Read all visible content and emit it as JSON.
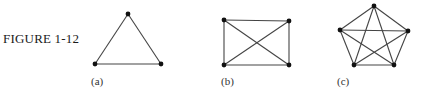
{
  "figure": {
    "caption": "FIGURE 1-12",
    "colors": {
      "edge": "#444444",
      "vertex": "#111111",
      "text": "#1a1a1a"
    },
    "panels": [
      {
        "id": "a",
        "label": "(a)",
        "graph": "K3",
        "vertices": [
          [
            128,
            14
          ],
          [
            95,
            64
          ],
          [
            161,
            64
          ]
        ],
        "edges": [
          [
            0,
            1
          ],
          [
            1,
            2
          ],
          [
            2,
            0
          ]
        ],
        "label_pos": [
          91,
          85
        ]
      },
      {
        "id": "b",
        "label": "(b)",
        "graph": "K4",
        "vertices": [
          [
            224,
            20
          ],
          [
            289,
            21
          ],
          [
            289,
            65
          ],
          [
            224,
            65
          ]
        ],
        "edges": [
          [
            0,
            1
          ],
          [
            1,
            2
          ],
          [
            2,
            3
          ],
          [
            3,
            0
          ],
          [
            0,
            2
          ],
          [
            1,
            3
          ]
        ],
        "label_pos": [
          221,
          85
        ]
      },
      {
        "id": "c",
        "label": "(c)",
        "graph": "K5",
        "vertices": [
          [
            374,
            6
          ],
          [
            408,
            31
          ],
          [
            394,
            65
          ],
          [
            354,
            65
          ],
          [
            340,
            30
          ]
        ],
        "edges": [
          [
            0,
            1
          ],
          [
            1,
            2
          ],
          [
            2,
            3
          ],
          [
            3,
            4
          ],
          [
            4,
            0
          ],
          [
            0,
            2
          ],
          [
            0,
            3
          ],
          [
            1,
            3
          ],
          [
            1,
            4
          ],
          [
            2,
            4
          ]
        ],
        "label_pos": [
          337,
          85
        ]
      }
    ]
  }
}
